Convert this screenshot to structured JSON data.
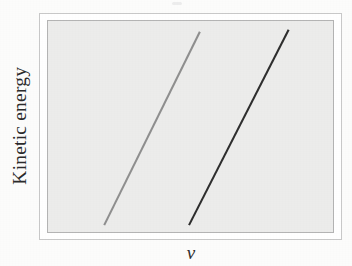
{
  "figure": {
    "kind": "scanned-textbook-figure",
    "background_color": "#fcfcfb"
  },
  "axes": {
    "y_label": "Kinetic energy",
    "x_label": "ν",
    "frame_outer_color": "#c9c9c9",
    "frame_inner_color": "#b4b4b4",
    "plot_fill_color": "#ececeb"
  },
  "chart_data": {
    "type": "line",
    "title": "",
    "subtitle": "",
    "xlabel": "ν",
    "ylabel": "Kinetic energy",
    "xlim": [
      0,
      100
    ],
    "ylim": [
      0,
      100
    ],
    "grid": false,
    "ticks": {
      "x": [],
      "y": []
    },
    "legend": {
      "show": false,
      "position": "none",
      "entries": []
    },
    "annotations": [],
    "series": [
      {
        "name": "metal-1-lower-threshold",
        "color": "#8f8f8f",
        "line_width_px": 2.1,
        "x": [
          22.0,
          55.0
        ],
        "y": [
          0.0,
          92.0
        ],
        "endpoints_px": {
          "x1": 103,
          "y1": 227,
          "x2": 200,
          "y2": 30
        }
      },
      {
        "name": "metal-2-higher-threshold",
        "color": "#2e2e2e",
        "line_width_px": 2.1,
        "x": [
          51.5,
          86.5
        ],
        "y": [
          0.0,
          93.0
        ],
        "endpoints_px": {
          "x1": 189,
          "y1": 227,
          "x2": 290,
          "y2": 28
        }
      }
    ]
  }
}
